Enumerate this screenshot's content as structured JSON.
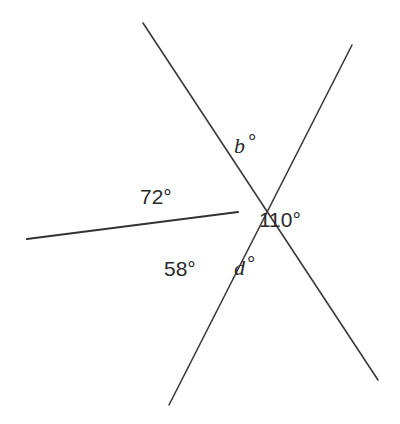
{
  "diagram": {
    "center": [
      238,
      212
    ],
    "lines": [
      {
        "name": "line-top-left-to-bottom-right",
        "from": [
          143,
          23
        ],
        "to": [
          378,
          380
        ]
      },
      {
        "name": "line-top-right-to-bottom",
        "from": [
          352,
          45
        ],
        "to": [
          169,
          405
        ]
      },
      {
        "name": "ray-left",
        "from": [
          27,
          239
        ],
        "to": [
          238,
          212
        ]
      }
    ],
    "labels": {
      "b": {
        "var": "b",
        "deg": "°"
      },
      "angle_72": "72°",
      "angle_110": "110°",
      "angle_58": "58°",
      "d": {
        "var": "d",
        "deg": "°"
      }
    }
  }
}
